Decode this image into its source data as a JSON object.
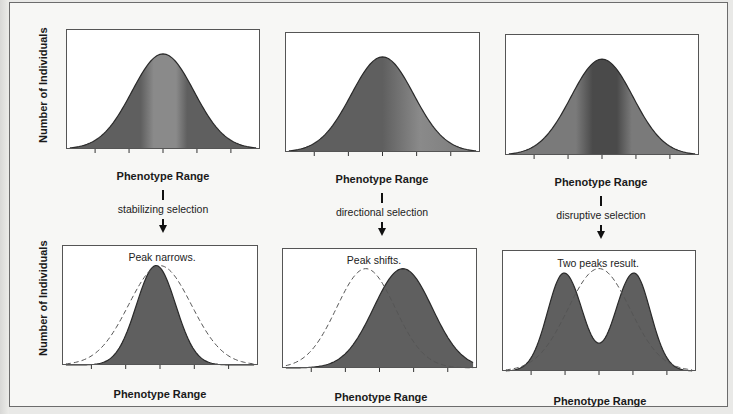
{
  "labels": {
    "y_axis": "Number of Individuals",
    "x_axis": "Phenotype Range"
  },
  "colors": {
    "fill_dark": "#5f5f5f",
    "fill_band_light": "#8a8a8a",
    "fill_band_dark": "#4a4a4a",
    "stroke": "#2a2a2a",
    "dashed": "#555555",
    "box_border": "#555555",
    "background": "#ffffff"
  },
  "columns": [
    {
      "id": "stabilizing",
      "selection_label": "stabilizing selection",
      "before": {
        "x_label": "Phenotype Range"
      },
      "after": {
        "annotation": "Peak narrows.",
        "x_label": "Phenotype Range"
      }
    },
    {
      "id": "directional",
      "selection_label": "directional selection",
      "before": {
        "x_label": "Phenotype Range"
      },
      "after": {
        "annotation": "Peak shifts.",
        "x_label": "Phenotype Range"
      }
    },
    {
      "id": "disruptive",
      "selection_label": "disruptive selection",
      "before": {
        "x_label": "Phenotype Range"
      },
      "after": {
        "annotation": "Two peaks result.",
        "x_label": "Phenotype Range"
      }
    }
  ],
  "chart_data": [
    {
      "type": "area",
      "title": "Before stabilizing selection",
      "xlabel": "Phenotype Range",
      "ylabel": "Number of Individuals",
      "x_ticks": 5,
      "series": [
        {
          "name": "original population",
          "shape": "normal",
          "mean": 0.5,
          "sd": 0.16,
          "peak": 0.9,
          "style": "filled",
          "band": "light-center"
        }
      ]
    },
    {
      "type": "area",
      "title": "Before directional selection",
      "xlabel": "Phenotype Range",
      "ylabel": "Number of Individuals",
      "x_ticks": 5,
      "series": [
        {
          "name": "original population",
          "shape": "normal",
          "mean": 0.5,
          "sd": 0.16,
          "peak": 0.9,
          "style": "filled",
          "band": "light-right"
        }
      ]
    },
    {
      "type": "area",
      "title": "Before disruptive selection",
      "xlabel": "Phenotype Range",
      "ylabel": "Number of Individuals",
      "x_ticks": 5,
      "series": [
        {
          "name": "original population",
          "shape": "normal",
          "mean": 0.5,
          "sd": 0.16,
          "peak": 0.9,
          "style": "filled",
          "band": "dark-center"
        }
      ]
    },
    {
      "type": "area",
      "title": "After stabilizing selection",
      "annotation": "Peak narrows.",
      "xlabel": "Phenotype Range",
      "ylabel": "Number of Individuals",
      "x_ticks": 5,
      "series": [
        {
          "name": "original population",
          "shape": "normal",
          "mean": 0.5,
          "sd": 0.16,
          "peak": 0.9,
          "style": "dashed"
        },
        {
          "name": "after selection",
          "shape": "normal",
          "mean": 0.48,
          "sd": 0.1,
          "peak": 0.9,
          "style": "filled"
        }
      ]
    },
    {
      "type": "area",
      "title": "After directional selection",
      "annotation": "Peak shifts.",
      "xlabel": "Phenotype Range",
      "ylabel": "Number of Individuals",
      "x_ticks": 5,
      "series": [
        {
          "name": "original population",
          "shape": "normal",
          "mean": 0.43,
          "sd": 0.15,
          "peak": 0.9,
          "style": "dashed"
        },
        {
          "name": "after selection",
          "shape": "normal",
          "mean": 0.62,
          "sd": 0.15,
          "peak": 0.9,
          "style": "filled"
        }
      ]
    },
    {
      "type": "area",
      "title": "After disruptive selection",
      "annotation": "Two peaks result.",
      "xlabel": "Phenotype Range",
      "ylabel": "Number of Individuals",
      "x_ticks": 5,
      "series": [
        {
          "name": "original population",
          "shape": "normal",
          "mean": 0.5,
          "sd": 0.16,
          "peak": 0.92,
          "style": "dashed"
        },
        {
          "name": "after selection",
          "shape": "bimodal",
          "means": [
            0.32,
            0.68
          ],
          "sd": 0.085,
          "peak": 0.88,
          "valley": 0.25,
          "style": "filled"
        }
      ]
    }
  ]
}
